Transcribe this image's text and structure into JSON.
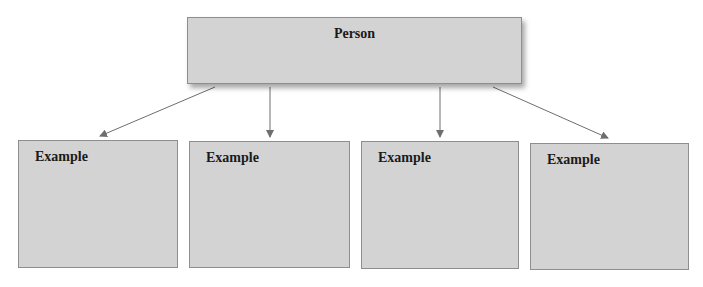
{
  "diagram": {
    "type": "hierarchy",
    "root": {
      "label": "Person"
    },
    "children": [
      {
        "label": "Example"
      },
      {
        "label": "Example"
      },
      {
        "label": "Example"
      },
      {
        "label": "Example"
      }
    ],
    "colors": {
      "box_fill": "#d3d3d3",
      "box_border": "#8e8e8e",
      "arrow": "#6e6e6e",
      "text": "#1a1a1a"
    }
  }
}
